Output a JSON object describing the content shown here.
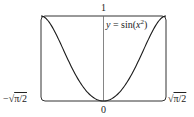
{
  "chart_data": {
    "type": "line",
    "title": "",
    "function_label": "y = sin(x²)",
    "series": [
      {
        "name": "y = sin(x^2)",
        "x": [
          -1.2533,
          -1.1,
          -0.9,
          -0.7,
          -0.5,
          -0.3,
          0,
          0.3,
          0.5,
          0.7,
          0.9,
          1.1,
          1.2533
        ],
        "values": [
          1.0,
          0.9356,
          0.7243,
          0.4706,
          0.2474,
          0.09,
          0,
          0.09,
          0.2474,
          0.4706,
          0.7243,
          0.9356,
          1.0
        ]
      }
    ],
    "xlim": [
      "-√(π/2)",
      "√(π/2)"
    ],
    "ylim": [
      0,
      1
    ],
    "x_tick_labels": [
      "-√π/2",
      "0",
      "√π/2"
    ],
    "y_tick_labels": [
      "1"
    ],
    "grid": false,
    "frame": "rounded rectangle viewing window"
  },
  "labels": {
    "y_top": "1",
    "x_origin": "0",
    "x_left_minus": "−",
    "x_left_val": "π/2",
    "x_right_val": "π/2",
    "func_y": "y",
    "func_eq": " = sin(",
    "func_x": "x",
    "func_sup": "2",
    "func_close": ")"
  },
  "colors": {
    "curve": "#1a1a1a",
    "frame": "#333333",
    "axis": "#555555"
  }
}
